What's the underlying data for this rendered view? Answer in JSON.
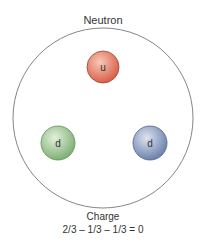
{
  "title": "Neutron",
  "quarks": [
    {
      "label": "u",
      "color": "#d9604a",
      "highlight": "#f7c9b8",
      "name": "up"
    },
    {
      "label": "d",
      "color": "#8fbf86",
      "highlight": "#e3f0dc",
      "name": "down"
    },
    {
      "label": "d",
      "color": "#7a8fb8",
      "highlight": "#dde3f1",
      "name": "down"
    }
  ],
  "charge": {
    "label": "Charge",
    "equation": "2/3 – 1/3 – 1/3 = 0"
  }
}
